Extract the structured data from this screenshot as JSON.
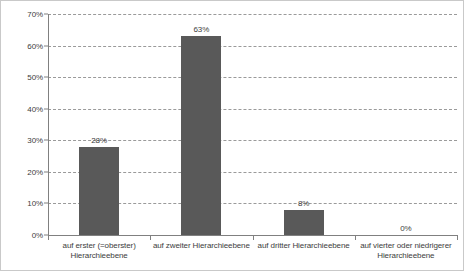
{
  "chart_data": {
    "type": "bar",
    "title": "",
    "subtitle": "",
    "xlabel": "",
    "ylabel": "",
    "categories": [
      "auf erster (=oberster) Hierarchieebene",
      "auf zweiter Hierarchieebene",
      "auf dritter Hierarchieebene",
      "auf vierter oder niedrigerer Hierarchieebene"
    ],
    "category_lines": [
      [
        "auf erster (=oberster)",
        "Hierarchieebene"
      ],
      [
        "auf zweiter Hierarchieebene"
      ],
      [
        "auf dritter Hierarchieebene"
      ],
      [
        "auf vierter oder niedrigerer",
        "Hierarchieebene"
      ]
    ],
    "values": [
      28,
      63,
      8,
      0
    ],
    "value_labels": [
      "28%",
      "63%",
      "8%",
      "0%"
    ],
    "ylim": [
      0,
      70
    ],
    "ytick_values": [
      0,
      10,
      20,
      30,
      40,
      50,
      60,
      70
    ],
    "ytick_labels": [
      "0%",
      "10%",
      "20%",
      "30%",
      "40%",
      "50%",
      "60%",
      "70%"
    ],
    "grid": true,
    "grid_style": "dashed",
    "legend": false,
    "bar_color": "#595959",
    "grid_color": "#9a9a9a",
    "axis_color": "#808080",
    "frame_color": "#c9c9c9",
    "text_color": "#3d3d3d",
    "background_color": "#ffffff"
  }
}
